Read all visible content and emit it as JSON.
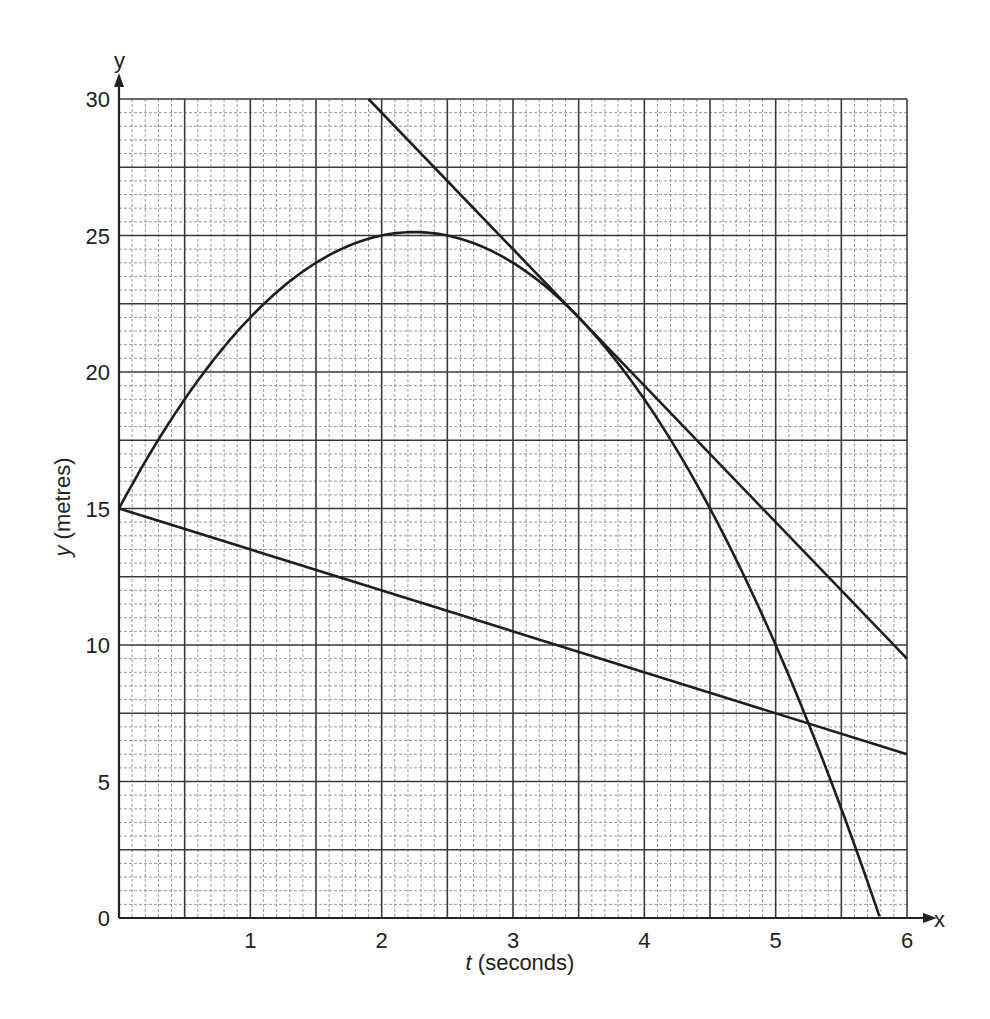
{
  "chart_data": {
    "type": "line",
    "title": "",
    "xlabel_italic": "t",
    "xlabel_rest": " (seconds)",
    "ylabel_italic": "y",
    "ylabel_rest": " (metres)",
    "x_axis_letter": "x",
    "y_axis_letter": "y",
    "xlim": [
      0,
      6
    ],
    "ylim": [
      0,
      30
    ],
    "x_ticks": [
      1,
      2,
      3,
      4,
      5,
      6
    ],
    "x_tick_labels": [
      "1",
      "2",
      "3",
      "4",
      "5",
      "6"
    ],
    "y_ticks": [
      0,
      5,
      10,
      15,
      20,
      25,
      30
    ],
    "y_tick_labels": [
      "0",
      "5",
      "10",
      "15",
      "20",
      "25",
      "30"
    ],
    "grid": {
      "major_x_step": 0.5,
      "major_y_step": 2.5,
      "minor_divisions": 5
    },
    "series": [
      {
        "name": "curve",
        "kind": "quadratic",
        "equation": "y = 15 + 9t - 2t^2",
        "t_range": [
          0,
          5.79
        ],
        "points": [
          [
            0,
            15
          ],
          [
            0.5,
            19
          ],
          [
            1,
            22
          ],
          [
            1.5,
            24
          ],
          [
            2,
            25
          ],
          [
            2.25,
            25.125
          ],
          [
            2.5,
            25
          ],
          [
            3,
            24
          ],
          [
            3.5,
            22
          ],
          [
            4,
            19
          ],
          [
            4.5,
            15
          ],
          [
            5,
            10
          ],
          [
            5.5,
            4
          ],
          [
            5.79,
            0
          ]
        ]
      },
      {
        "name": "tangent",
        "kind": "line",
        "equation": "y = 39.5 - 5t",
        "points": [
          [
            1.9,
            30
          ],
          [
            3.5,
            22
          ],
          [
            6,
            9.5
          ]
        ]
      },
      {
        "name": "chord",
        "kind": "line",
        "equation": "y = 15 - 1.5t",
        "points": [
          [
            0,
            15
          ],
          [
            6,
            6
          ]
        ]
      }
    ],
    "legend": null
  }
}
